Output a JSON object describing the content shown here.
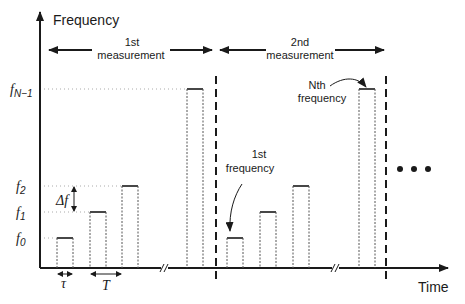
{
  "diagram": {
    "y_axis_label": "Frequency",
    "x_axis_label": "Time",
    "levels": [
      {
        "id": "f0",
        "base": "f",
        "sub": "0"
      },
      {
        "id": "f1",
        "base": "f",
        "sub": "1"
      },
      {
        "id": "f2",
        "base": "f",
        "sub": "2"
      },
      {
        "id": "fN-1",
        "base": "f",
        "sub": "N−1"
      }
    ],
    "measurements": [
      {
        "line1": "1st",
        "line2": "measurement"
      },
      {
        "line1": "2nd",
        "line2": "measurement"
      }
    ],
    "annotations": {
      "first_frequency": {
        "line1": "1st",
        "line2": "frequency"
      },
      "nth_frequency": {
        "line1": "Nth",
        "line2": "frequency"
      },
      "delta_f": "Δf",
      "tau": "τ",
      "period": "T",
      "continuation": "• • •"
    }
  }
}
